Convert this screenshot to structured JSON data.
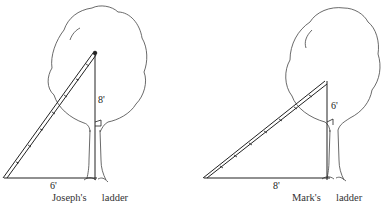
{
  "figures": [
    {
      "id": "joseph",
      "caption_name": "Joseph's",
      "caption_word": "ladder",
      "vertical_label": "8'",
      "base_label": "6'"
    },
    {
      "id": "mark",
      "caption_name": "Mark's",
      "caption_word": "ladder",
      "vertical_label": "6'",
      "base_label": "8'"
    }
  ],
  "colors": {
    "ink": "#222222",
    "background": "#ffffff"
  }
}
